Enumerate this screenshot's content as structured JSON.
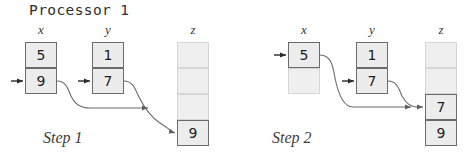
{
  "title": "Processor 1",
  "colors": {
    "cell_fill": "#ececec",
    "cell_border": "#6b6b6b",
    "empty_fill": "#efefef",
    "empty_border": "#d6d6d6",
    "wire": "#6a6a6a",
    "pointer": "#2a2a2a",
    "text": "#1d1d1d",
    "background": "#ffffff"
  },
  "steps": [
    {
      "caption": "Step 1",
      "arrays": [
        {
          "label": "x",
          "cells": [
            {
              "value": "5",
              "filled": true,
              "pointed": false
            },
            {
              "value": "9",
              "filled": true,
              "pointed": true
            }
          ]
        },
        {
          "label": "y",
          "cells": [
            {
              "value": "1",
              "filled": true,
              "pointed": false
            },
            {
              "value": "7",
              "filled": true,
              "pointed": true
            }
          ]
        },
        {
          "label": "z",
          "cells": [
            {
              "value": "",
              "filled": false,
              "pointed": false
            },
            {
              "value": "",
              "filled": false,
              "pointed": false
            },
            {
              "value": "",
              "filled": false,
              "pointed": false
            },
            {
              "value": "9",
              "filled": true,
              "pointed": true
            }
          ]
        }
      ]
    },
    {
      "caption": "Step 2",
      "arrays": [
        {
          "label": "x",
          "cells": [
            {
              "value": "5",
              "filled": true,
              "pointed": true
            },
            {
              "value": "",
              "filled": false,
              "pointed": false
            }
          ]
        },
        {
          "label": "y",
          "cells": [
            {
              "value": "1",
              "filled": true,
              "pointed": false
            },
            {
              "value": "7",
              "filled": true,
              "pointed": true
            }
          ]
        },
        {
          "label": "z",
          "cells": [
            {
              "value": "",
              "filled": false,
              "pointed": false
            },
            {
              "value": "",
              "filled": false,
              "pointed": false
            },
            {
              "value": "7",
              "filled": true,
              "pointed": true
            },
            {
              "value": "9",
              "filled": true,
              "pointed": false
            }
          ]
        }
      ]
    }
  ]
}
